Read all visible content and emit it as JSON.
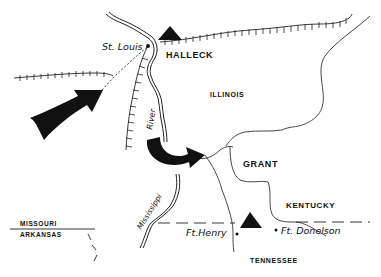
{
  "map": {
    "style": "hand-drawn historical campaign map",
    "colors": {
      "ink": "#111111",
      "background": "#ffffff"
    },
    "labels": {
      "st_louis": "St. Louis",
      "halleck": "HALLECK",
      "illinois": "ILLINOIS",
      "river": "River",
      "mississippi": "Mississippi",
      "grant": "GRANT",
      "kentucky": "KENTUCKY",
      "missouri": "MISSOURI",
      "arkansas": "ARKANSAS",
      "ft_henry": "Ft.Henry",
      "ft_donelson": "Ft. Donelson",
      "tennessee": "TENNESSEE"
    },
    "symbols": [
      {
        "type": "army-triangle",
        "label": "Halleck",
        "x": 170,
        "y": 35
      },
      {
        "type": "army-triangle",
        "label": "Grant",
        "x": 250,
        "y": 218
      },
      {
        "type": "large-arrow",
        "direction": "northeast",
        "description": "advance toward St. Louis"
      },
      {
        "type": "curved-arrow",
        "direction": "east",
        "description": "movement toward Grant's position"
      }
    ],
    "features": [
      "Mississippi River",
      "railroads (hatched lines)",
      "state borders",
      "Tennessee River",
      "Cumberland River"
    ]
  }
}
